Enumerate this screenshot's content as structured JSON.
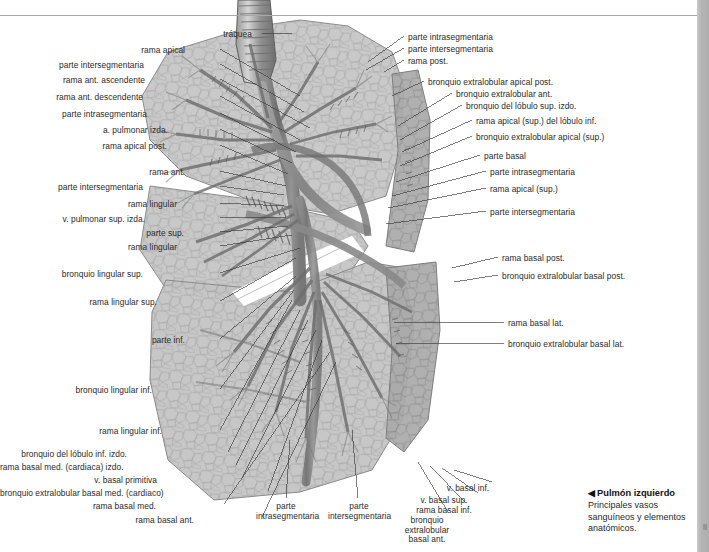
{
  "page": {
    "title": "Pulmón izquierdo",
    "background": "#ffffff",
    "rule_color": "#a8a8ac",
    "edge_color": "#b4b4b4"
  },
  "caption": {
    "arrow": "◀",
    "title": "Pulmón izquierdo",
    "body": "Principales vasos sanguíneos y elementos anatómicos."
  },
  "labels_left": [
    {
      "text": "tráquea",
      "x": 252,
      "y": 30,
      "lx1": 262,
      "ly1": 33,
      "lx2": 292,
      "ly2": 33
    },
    {
      "text": "rama apical",
      "x": 185,
      "y": 46,
      "lx1": 220,
      "ly1": 49,
      "lx2": 300,
      "ly2": 96
    },
    {
      "text": "parte intersegmentaria",
      "x": 144,
      "y": 61,
      "lx1": 220,
      "ly1": 64,
      "lx2": 304,
      "ly2": 112
    },
    {
      "text": "rama ant. ascendente",
      "x": 145,
      "y": 76,
      "lx1": 220,
      "ly1": 79,
      "lx2": 310,
      "ly2": 128
    },
    {
      "text": "rama ant. descendente",
      "x": 143,
      "y": 93,
      "lx1": 220,
      "ly1": 96,
      "lx2": 300,
      "ly2": 140
    },
    {
      "text": "parte intrasegmentaria",
      "x": 147,
      "y": 110,
      "lx1": 220,
      "ly1": 113,
      "lx2": 296,
      "ly2": 152
    },
    {
      "text": "a. pulmonar izda.",
      "x": 168,
      "y": 126,
      "lx1": 220,
      "ly1": 129,
      "lx2": 292,
      "ly2": 163
    },
    {
      "text": "rama apical post.",
      "x": 167,
      "y": 142,
      "lx1": 220,
      "ly1": 145,
      "lx2": 288,
      "ly2": 174
    },
    {
      "text": "rama ant.",
      "x": 185,
      "y": 168,
      "lx1": 220,
      "ly1": 171,
      "lx2": 286,
      "ly2": 186
    },
    {
      "text": "parte intersegmentaria",
      "x": 143,
      "y": 183,
      "lx1": 220,
      "ly1": 186,
      "lx2": 284,
      "ly2": 195
    },
    {
      "text": "rama lingular",
      "x": 177,
      "y": 200,
      "lx1": 220,
      "ly1": 203,
      "lx2": 284,
      "ly2": 206
    },
    {
      "text": "v. pulmonar sup. izda.",
      "x": 145,
      "y": 215,
      "lx1": 220,
      "ly1": 218,
      "lx2": 286,
      "ly2": 217
    },
    {
      "text": "parte sup.",
      "x": 184,
      "y": 229,
      "lx1": 220,
      "ly1": 232,
      "lx2": 288,
      "ly2": 226
    },
    {
      "text": "rama lingular",
      "x": 177,
      "y": 243,
      "lx1": 220,
      "ly1": 246,
      "lx2": 292,
      "ly2": 235
    },
    {
      "text": "bronquio lingular sup.",
      "x": 143,
      "y": 270,
      "lx1": 220,
      "ly1": 273,
      "lx2": 300,
      "ly2": 248
    },
    {
      "text": "rama lingular sup.",
      "x": 157,
      "y": 298,
      "lx1": 220,
      "ly1": 301,
      "lx2": 296,
      "ly2": 258
    },
    {
      "text": "parte inf.",
      "x": 185,
      "y": 336,
      "lx1": 220,
      "ly1": 339,
      "lx2": 296,
      "ly2": 276
    },
    {
      "text": "bronquio lingular inf.",
      "x": 152,
      "y": 386,
      "lx1": 220,
      "ly1": 389,
      "lx2": 294,
      "ly2": 290
    },
    {
      "text": "rama lingular inf.",
      "x": 162,
      "y": 427,
      "lx1": 220,
      "ly1": 430,
      "lx2": 292,
      "ly2": 300
    },
    {
      "text": "bronquio del lóbulo inf. izdo.",
      "x": 127,
      "y": 450,
      "lx1": 228,
      "ly1": 452,
      "lx2": 300,
      "ly2": 310
    },
    {
      "text": "rama basal med. (cardiaca) izdo.",
      "x": 119,
      "y": 463,
      "lx1": 236,
      "ly1": 465,
      "lx2": 308,
      "ly2": 320
    },
    {
      "text": "v. basal primitiva",
      "x": 157,
      "y": 476,
      "lx1": 242,
      "ly1": 478,
      "lx2": 316,
      "ly2": 330
    },
    {
      "text": "bronquio extralobular basal med. (cardiaco)",
      "x": 104,
      "y": 489,
      "lx1": 268,
      "ly1": 491,
      "lx2": 322,
      "ly2": 340
    },
    {
      "text": "rama basal med.",
      "x": 156,
      "y": 502,
      "lx1": 224,
      "ly1": 504,
      "lx2": 330,
      "ly2": 352
    },
    {
      "text": "rama basal ant.",
      "x": 194,
      "y": 516,
      "lx1": 262,
      "ly1": 517,
      "lx2": 336,
      "ly2": 362
    }
  ],
  "labels_right": [
    {
      "text": "parte intrasegmentaria",
      "x": 408,
      "y": 33,
      "lx1": 404,
      "ly1": 36,
      "lx2": 368,
      "ly2": 62
    },
    {
      "text": "parte intersegmentaria",
      "x": 408,
      "y": 45,
      "lx1": 404,
      "ly1": 48,
      "lx2": 366,
      "ly2": 70
    },
    {
      "text": "rama post.",
      "x": 408,
      "y": 57,
      "lx1": 404,
      "ly1": 60,
      "lx2": 384,
      "ly2": 72
    },
    {
      "text": "bronquio extralobular apical post.",
      "x": 428,
      "y": 78,
      "lx1": 424,
      "ly1": 81,
      "lx2": 392,
      "ly2": 96
    },
    {
      "text": "bronquio extralobular ant.",
      "x": 456,
      "y": 90,
      "lx1": 452,
      "ly1": 93,
      "lx2": 398,
      "ly2": 126
    },
    {
      "text": "bronquio del lóbulo sup. izdo.",
      "x": 466,
      "y": 102,
      "lx1": 462,
      "ly1": 105,
      "lx2": 400,
      "ly2": 140
    },
    {
      "text": "rama apical (sup.) del lóbulo inf.",
      "x": 476,
      "y": 117,
      "lx1": 472,
      "ly1": 120,
      "lx2": 402,
      "ly2": 152
    },
    {
      "text": "bronquio extralobular apical (sup.)",
      "x": 476,
      "y": 133,
      "lx1": 472,
      "ly1": 136,
      "lx2": 400,
      "ly2": 166
    },
    {
      "text": "parte basal",
      "x": 484,
      "y": 152,
      "lx1": 480,
      "ly1": 155,
      "lx2": 396,
      "ly2": 182
    },
    {
      "text": "parte intrasegmentaria",
      "x": 490,
      "y": 168,
      "lx1": 486,
      "ly1": 171,
      "lx2": 392,
      "ly2": 196
    },
    {
      "text": "rama apical (sup.)",
      "x": 490,
      "y": 185,
      "lx1": 486,
      "ly1": 188,
      "lx2": 388,
      "ly2": 208
    },
    {
      "text": "parte intersegmentaria",
      "x": 490,
      "y": 208,
      "lx1": 486,
      "ly1": 211,
      "lx2": 386,
      "ly2": 224
    },
    {
      "text": "rama basal post.",
      "x": 502,
      "y": 254,
      "lx1": 498,
      "ly1": 257,
      "lx2": 452,
      "ly2": 268
    },
    {
      "text": "bronquio extralobular basal post.",
      "x": 502,
      "y": 272,
      "lx1": 498,
      "ly1": 275,
      "lx2": 454,
      "ly2": 282
    },
    {
      "text": "rama basal lat.",
      "x": 508,
      "y": 319,
      "lx1": 504,
      "ly1": 322,
      "lx2": 394,
      "ly2": 322
    },
    {
      "text": "bronquio extralobular basal lat.",
      "x": 508,
      "y": 340,
      "lx1": 504,
      "ly1": 343,
      "lx2": 396,
      "ly2": 343
    }
  ],
  "labels_bottom": [
    {
      "text": "parte\nintrasegmentaria",
      "x": 256,
      "y": 502,
      "w": 60,
      "lx1": 286,
      "ly1": 498,
      "lx2": 290,
      "ly2": 440
    },
    {
      "text": "parte\nintersegmentaria",
      "x": 328,
      "y": 502,
      "w": 62,
      "lx1": 358,
      "ly1": 498,
      "lx2": 352,
      "ly2": 430
    },
    {
      "text": "bronquio extralobular basal ant.",
      "x": 395,
      "y": 516,
      "w": 0,
      "lx1": 448,
      "ly1": 512,
      "lx2": 418,
      "ly2": 462
    },
    {
      "text": "rama basal inf.",
      "x": 412,
      "y": 506,
      "w": 0,
      "lx1": 466,
      "ly1": 503,
      "lx2": 430,
      "ly2": 466
    },
    {
      "text": "v. basal sup.",
      "x": 412,
      "y": 496,
      "w": 0,
      "lx1": 478,
      "ly1": 493,
      "lx2": 442,
      "ly2": 468
    },
    {
      "text": "v. basal inf.",
      "x": 436,
      "y": 484,
      "w": 0,
      "lx1": 492,
      "ly1": 482,
      "lx2": 454,
      "ly2": 470
    }
  ]
}
